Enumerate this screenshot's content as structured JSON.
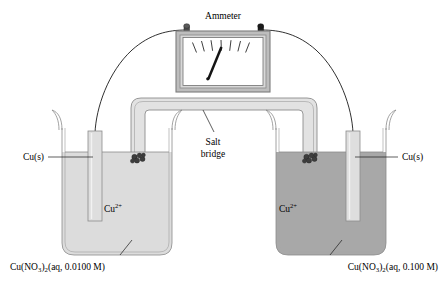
{
  "figure": {
    "width": 448,
    "height": 287,
    "background": "#ffffff"
  },
  "meter": {
    "label": "Ammeter",
    "needle_reading_note": "needle deflected left of center",
    "terminal_left": "terminal-post-left",
    "terminal_right": "terminal-post-right",
    "tick_count": 7,
    "face_color": "#ffffff",
    "frame_color": "#9a9a9a",
    "needle_color": "#111111"
  },
  "salt_bridge": {
    "label_line1": "Salt",
    "label_line2": "bridge",
    "fill_color": "#e2e2e2",
    "plug_color": "#3d3d3d"
  },
  "left_cell": {
    "electrode_label": "Cu(s)",
    "ion_label": "Cu",
    "ion_charge": "2+",
    "solution_formula": "Cu(NO",
    "solution_sub1": "3",
    "solution_mid": ")",
    "solution_sub2": "2",
    "solution_tail": "(aq, 0.0100 M)",
    "solution_full": "Cu(NO3)2(aq, 0.0100 M)",
    "concentration": "0.0100 M",
    "solution_color": "#dcdcdc",
    "electrode_color": "#dedede"
  },
  "right_cell": {
    "electrode_label": "Cu(s)",
    "ion_label": "Cu",
    "ion_charge": "2+",
    "solution_formula": "Cu(NO",
    "solution_sub1": "3",
    "solution_mid": ")",
    "solution_sub2": "2",
    "solution_tail": "(aq, 0.100 M)",
    "solution_full": "Cu(NO3)2(aq, 0.100 M)",
    "concentration": "0.100 M",
    "solution_color": "#a8a8a8",
    "electrode_color": "#dedede"
  },
  "colors": {
    "outline": "#1a1a1a",
    "glass": "#8c8c8c",
    "text": "#000000"
  }
}
